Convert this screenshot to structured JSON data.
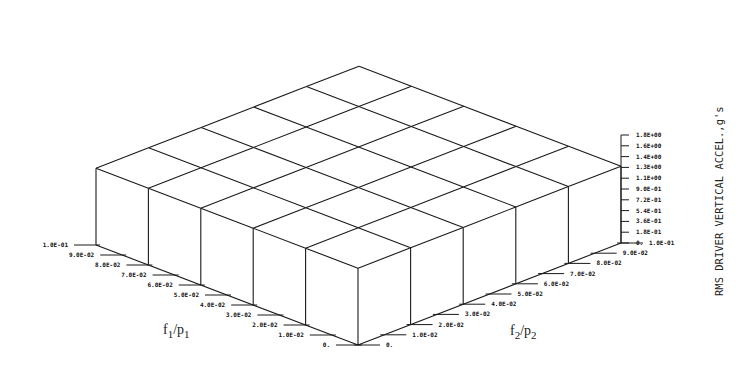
{
  "chart_data": {
    "type": "3d-surface",
    "title": "",
    "xlabel": "f1/p1",
    "ylabel": "f2/p2",
    "zlabel": "RMS DRIVER VERTICAL ACCEL.,g's",
    "x_ticks": [
      "0.",
      "1.0E-02",
      "2.0E-02",
      "3.0E-02",
      "4.0E-02",
      "5.0E-02",
      "6.0E-02",
      "7.0E-02",
      "8.0E-02",
      "9.0E-02",
      "1.0E-01"
    ],
    "y_ticks": [
      "0.",
      "1.0E-02",
      "2.0E-02",
      "3.0E-02",
      "4.0E-02",
      "5.0E-02",
      "6.0E-02",
      "7.0E-02",
      "8.0E-02",
      "9.0E-02",
      "1.0E-01"
    ],
    "z_ticks": [
      "0.",
      "1.8E-01",
      "3.6E-01",
      "5.4E-01",
      "7.2E-01",
      "9.0E-01",
      "1.1E+00",
      "1.3E+00",
      "1.4E+00",
      "1.6E+00",
      "1.8E+00"
    ],
    "xlim": [
      0,
      0.1
    ],
    "ylim": [
      0,
      0.1
    ],
    "zlim": [
      0,
      1.8
    ],
    "grid_x": [
      0,
      0.02,
      0.04,
      0.06,
      0.08,
      0.1
    ],
    "grid_y": [
      0,
      0.02,
      0.04,
      0.06,
      0.08,
      0.1
    ],
    "z_values": [
      [
        1.28,
        1.28,
        1.28,
        1.28,
        1.28,
        1.28
      ],
      [
        1.28,
        1.28,
        1.28,
        1.28,
        1.28,
        1.28
      ],
      [
        1.28,
        1.28,
        1.28,
        1.28,
        1.28,
        1.28
      ],
      [
        1.28,
        1.28,
        1.28,
        1.28,
        1.28,
        1.28
      ],
      [
        1.28,
        1.28,
        1.28,
        1.28,
        1.28,
        1.28
      ],
      [
        1.28,
        1.28,
        1.28,
        1.28,
        1.28,
        1.28
      ]
    ],
    "note": "Surface is essentially flat at approx. 1.3 g's across the f1/p1 and f2/p2 domain"
  },
  "labels": {
    "x_axis_title_main": "f",
    "x_axis_title_sub1": "1",
    "x_axis_title_slash": "/p",
    "x_axis_title_sub2": "1",
    "y_axis_title_main": "f",
    "y_axis_title_sub1": "2",
    "y_axis_title_slash": "/p",
    "y_axis_title_sub2": "2",
    "z_axis_title": "RMS DRIVER VERTICAL ACCEL.,g's"
  }
}
